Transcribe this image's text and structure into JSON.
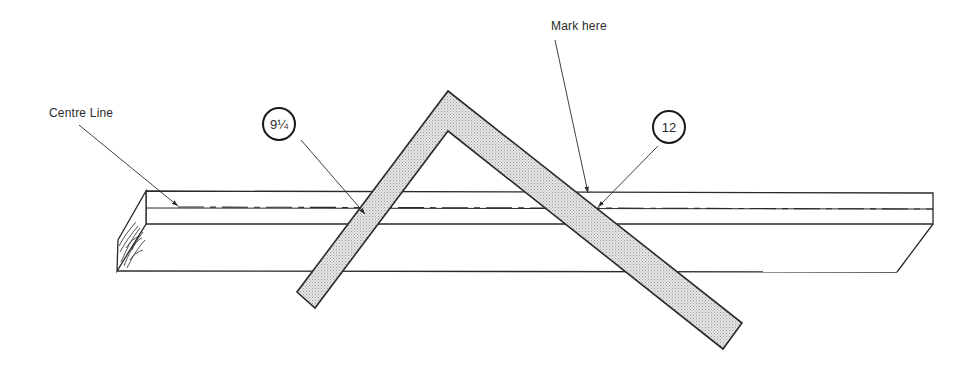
{
  "diagram": {
    "labels": {
      "centre_line": "Centre Line",
      "mark_here": "Mark here"
    },
    "callouts": {
      "left_measure": "9¼",
      "right_measure": "12"
    },
    "colors": {
      "line": "#2a2a2a",
      "square_fill": "#d9d9d9",
      "background": "#ffffff"
    },
    "icons": {
      "board": "timber-board",
      "square": "steel-framing-square"
    }
  }
}
